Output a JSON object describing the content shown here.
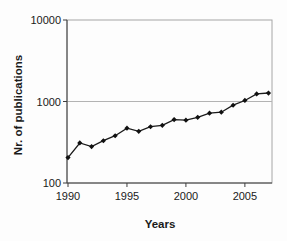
{
  "figure": {
    "type_note": "line chart on logarithmic y-axis"
  },
  "chart_data": {
    "type": "line",
    "title": "",
    "xlabel": "Years",
    "ylabel": "Nr. of publications",
    "x": [
      1990,
      1991,
      1992,
      1993,
      1994,
      1995,
      1996,
      1997,
      1998,
      1999,
      2000,
      2001,
      2002,
      2003,
      2004,
      2005,
      2006,
      2007
    ],
    "series": [
      {
        "name": "publications",
        "values": [
          205,
          310,
          280,
          330,
          380,
          470,
          430,
          490,
          510,
          600,
          590,
          640,
          720,
          740,
          900,
          1030,
          1240,
          1270
        ]
      }
    ],
    "yscale": "log",
    "ylim": [
      100,
      10000
    ],
    "yticks": [
      100,
      1000,
      10000
    ],
    "ytick_labels": [
      "100",
      "1000",
      "10000"
    ],
    "xticks": [
      1990,
      1995,
      2000,
      2005
    ],
    "xtick_labels": [
      "1990",
      "1995",
      "2000",
      "2005"
    ],
    "xlim": [
      1990,
      2007.3
    ],
    "grid": "horizontal major only",
    "legend": "none",
    "marker": "filled-diamond",
    "colors": {
      "line": "#1a1a1a",
      "marker": "#111111",
      "gridline": "#b3b3b3",
      "frame": "#a6a6a6",
      "axis": "#3d3d3d",
      "background": "#fdfdfd"
    }
  }
}
